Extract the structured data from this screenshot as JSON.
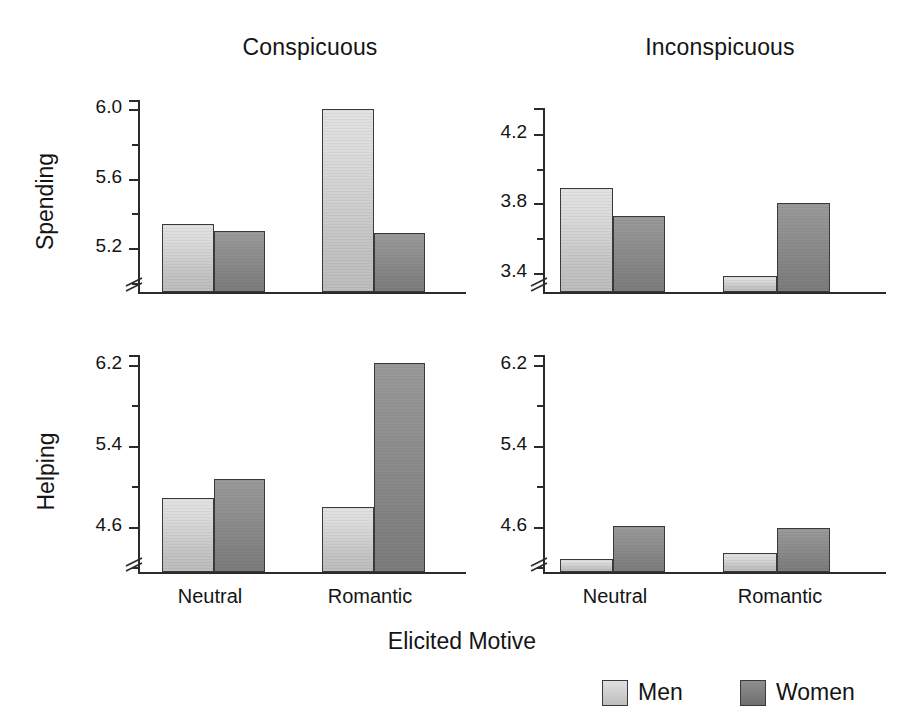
{
  "figure": {
    "x_axis_title": "Elicited Motive",
    "column_titles": [
      "Conspicuous",
      "Inconspicuous"
    ],
    "row_titles": [
      "Spending",
      "Helping"
    ],
    "x_categories": [
      "Neutral",
      "Romantic"
    ],
    "legend": {
      "entries": [
        {
          "label": "Men",
          "color": "#d2d2d2"
        },
        {
          "label": "Women",
          "color": "#858585"
        }
      ]
    }
  },
  "chart_data": [
    {
      "type": "bar",
      "title": "Conspicuous",
      "ylabel": "Spending",
      "xlabel": "Elicited Motive",
      "categories": [
        "Neutral",
        "Romantic"
      ],
      "series": [
        {
          "name": "Men",
          "values": [
            5.34,
            6.0
          ]
        },
        {
          "name": "Women",
          "values": [
            5.3,
            5.29
          ]
        }
      ],
      "ylim": [
        4.95,
        6.05
      ],
      "yticks": [
        "6.0",
        "5.6",
        "5.2"
      ],
      "ytick_values": [
        6.0,
        5.6,
        5.2
      ],
      "yminor_values": [
        5.8,
        5.4,
        5.0
      ],
      "axis_break": true,
      "grid": false
    },
    {
      "type": "bar",
      "title": "Inconspicuous",
      "ylabel": "Spending",
      "xlabel": "Elicited Motive",
      "categories": [
        "Neutral",
        "Romantic"
      ],
      "series": [
        {
          "name": "Men",
          "values": [
            3.89,
            3.38
          ]
        },
        {
          "name": "Women",
          "values": [
            3.73,
            3.8
          ]
        }
      ],
      "ylim": [
        3.29,
        4.35
      ],
      "yticks": [
        "4.2",
        "3.8",
        "3.4"
      ],
      "ytick_values": [
        4.2,
        3.8,
        3.4
      ],
      "yminor_values": [
        4.0,
        3.6
      ],
      "axis_break": true,
      "grid": false
    },
    {
      "type": "bar",
      "title": "Conspicuous",
      "ylabel": "Helping",
      "xlabel": "Elicited Motive",
      "categories": [
        "Neutral",
        "Romantic"
      ],
      "series": [
        {
          "name": "Men",
          "values": [
            4.88,
            4.79
          ]
        },
        {
          "name": "Women",
          "values": [
            5.07,
            6.22
          ]
        }
      ],
      "ylim": [
        4.15,
        6.3
      ],
      "yticks": [
        "6.2",
        "5.4",
        "4.6"
      ],
      "ytick_values": [
        6.2,
        5.4,
        4.6
      ],
      "yminor_values": [
        5.8,
        5.0,
        4.2
      ],
      "axis_break": true,
      "grid": false
    },
    {
      "type": "bar",
      "title": "Inconspicuous",
      "ylabel": "Helping",
      "xlabel": "Elicited Motive",
      "categories": [
        "Neutral",
        "Romantic"
      ],
      "series": [
        {
          "name": "Men",
          "values": [
            4.28,
            4.34
          ]
        },
        {
          "name": "Women",
          "values": [
            4.61,
            4.59
          ]
        }
      ],
      "ylim": [
        4.15,
        6.3
      ],
      "yticks": [
        "6.2",
        "5.4",
        "4.6"
      ],
      "ytick_values": [
        6.2,
        5.4,
        4.6
      ],
      "yminor_values": [
        5.8,
        5.0,
        4.2
      ],
      "axis_break": true,
      "grid": false
    }
  ]
}
